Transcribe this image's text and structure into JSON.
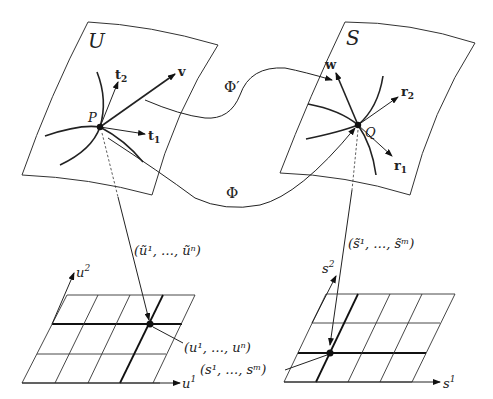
{
  "diagram": {
    "left_surface": {
      "label": "U",
      "point": "P",
      "vectors": {
        "t1": "t",
        "t1_sub": "1",
        "t2": "t",
        "t2_sub": "2",
        "v": "v"
      }
    },
    "right_surface": {
      "label": "S",
      "point": "Q",
      "vectors": {
        "r1": "r",
        "r1_sub": "1",
        "r2": "r",
        "r2_sub": "2",
        "w": "w"
      }
    },
    "maps": {
      "phi_prime": "Φ′",
      "phi": "Φ"
    },
    "left_chart": {
      "map_label": "(ũ¹, …, ũⁿ)",
      "axis_x": "u",
      "axis_x_sup": "1",
      "axis_y": "u",
      "axis_y_sup": "2",
      "point_label": "(u¹, …, uⁿ)"
    },
    "right_chart": {
      "map_label": "(s̃¹, …, s̃ᵐ)",
      "axis_x": "s",
      "axis_x_sup": "1",
      "axis_y": "s",
      "axis_y_sup": "2",
      "point_label": "(s¹, …, sᵐ)"
    }
  }
}
